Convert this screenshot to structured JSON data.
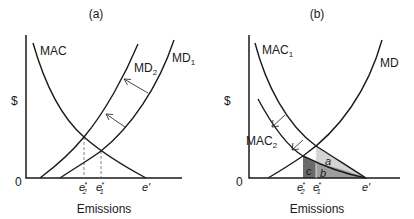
{
  "panel_a": {
    "title": "(a)",
    "y_axis_label": "$",
    "origin_label": "0",
    "x_axis_label": "Emissions",
    "curves": {
      "mac": "MAC",
      "md2": "MD",
      "md2_sub": "2",
      "md1": "MD",
      "md1_sub": "1"
    },
    "ticks": {
      "e2_base": "e",
      "e2_sub": "2",
      "e2_sup": "*",
      "e1_base": "e",
      "e1_sub": "1",
      "e1_sup": "*",
      "eprime": "e'"
    }
  },
  "panel_b": {
    "title": "(b)",
    "y_axis_label": "$",
    "origin_label": "0",
    "x_axis_label": "Emissions",
    "curves": {
      "mac1": "MAC",
      "mac1_sub": "1",
      "mac2": "MAC",
      "mac2_sub": "2",
      "md": "MD"
    },
    "areas": {
      "a": "a",
      "b": "b",
      "c": "c"
    },
    "area_colors": {
      "a": "#d4d4d4",
      "b": "#9e9e9e",
      "c": "#6b6b6b"
    },
    "ticks": {
      "e2_base": "e",
      "e2_sub": "2",
      "e2_sup": "*",
      "e1_base": "e",
      "e1_sub": "1",
      "e1_sup": "*",
      "eprime": "e'"
    }
  }
}
